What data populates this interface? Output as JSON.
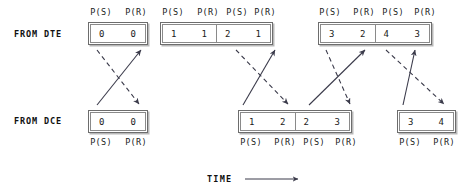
{
  "diagram": {
    "title_rows": {
      "dte": "FROM DTE",
      "dce": "FROM DCE"
    },
    "header_label_ps": "P(S)",
    "header_label_pr": "P(R)",
    "time_axis": {
      "label": "TIME",
      "arrow_name": "time-arrow"
    },
    "colors": {
      "frame_border": "#6d6d6d",
      "frame_shadow": "#b9b9b9",
      "text": "#1a1a1a",
      "arrow": "#3a3a4a"
    },
    "dte_groups": [
      {
        "id": "dte-group-1",
        "cells": [
          {
            "ps": "0",
            "pr": "0"
          }
        ]
      },
      {
        "id": "dte-group-2",
        "cells": [
          {
            "ps": "1",
            "pr": "1"
          },
          {
            "ps": "2",
            "pr": "1"
          }
        ]
      },
      {
        "id": "dte-group-3",
        "cells": [
          {
            "ps": "3",
            "pr": "2"
          },
          {
            "ps": "4",
            "pr": "3"
          }
        ]
      }
    ],
    "dce_groups": [
      {
        "id": "dce-group-1",
        "cells": [
          {
            "ps": "0",
            "pr": "0"
          }
        ]
      },
      {
        "id": "dce-group-2",
        "cells": [
          {
            "ps": "1",
            "pr": "2"
          },
          {
            "ps": "2",
            "pr": "3"
          }
        ]
      },
      {
        "id": "dce-group-3",
        "cells": [
          {
            "ps": "3",
            "pr": "4"
          }
        ]
      }
    ],
    "arrow_pairs": [
      {
        "id": "exchange-1",
        "dashed_dir": "down-right",
        "solid_dir": "up-right"
      },
      {
        "id": "exchange-2",
        "dashed_dir": "down-right",
        "solid_dir": "up-right"
      },
      {
        "id": "exchange-3",
        "dashed_dir": "down-right",
        "solid_dir": "up-right"
      },
      {
        "id": "exchange-4",
        "dashed_dir": "down-right",
        "solid_dir": "up-right"
      }
    ]
  }
}
